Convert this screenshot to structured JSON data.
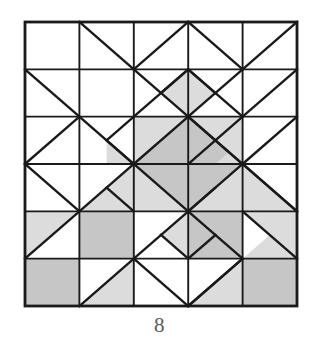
{
  "figure": {
    "caption": "8",
    "colors": {
      "background": "#ffffff",
      "line": "#1a1a1a",
      "shade_light": "#d6d6d6",
      "shade_mid": "#cacaca",
      "shade_dark": "#bdbdbd",
      "caption_text": "#5a5a5a"
    },
    "grid": {
      "columns": 5,
      "rows": 6,
      "left": 25,
      "top": 22,
      "right": 297,
      "bottom": 306,
      "cell_width": 54.4,
      "cell_height": 47.33,
      "x_lines": [
        25,
        79.4,
        133.8,
        188.2,
        242.6,
        297
      ],
      "y_lines": [
        22,
        69.33,
        116.67,
        164,
        211.33,
        258.67,
        306
      ],
      "border_width": 2.6,
      "line_width": 2.4
    },
    "shaded_regions": [
      {
        "name": "center-diamond",
        "shade": "mid"
      },
      {
        "name": "upper-left-center-triangle",
        "shade": "light"
      },
      {
        "name": "upper-right-center-triangle",
        "shade": "light"
      },
      {
        "name": "lower-left-center-triangle",
        "shade": "light"
      },
      {
        "name": "lower-right-center-triangle",
        "shade": "light"
      },
      {
        "name": "top-small-diamond",
        "shade": "light"
      },
      {
        "name": "bottom-small-diamond",
        "shade": "light"
      },
      {
        "name": "left-inner-triangles",
        "shade": "light"
      },
      {
        "name": "right-inner-triangles",
        "shade": "light"
      },
      {
        "name": "row5-col2-square",
        "shade": "mid"
      },
      {
        "name": "row5-col4-square",
        "shade": "mid"
      },
      {
        "name": "row6-col1-square",
        "shade": "mid"
      },
      {
        "name": "row6-col5-square",
        "shade": "mid"
      },
      {
        "name": "row5-col1-triangle",
        "shade": "light"
      },
      {
        "name": "row5-col5-triangle",
        "shade": "light"
      },
      {
        "name": "row6-col2-triangle",
        "shade": "light"
      },
      {
        "name": "row6-col4-triangle",
        "shade": "light"
      },
      {
        "name": "row6-col3-triangles",
        "shade": "light"
      }
    ]
  }
}
